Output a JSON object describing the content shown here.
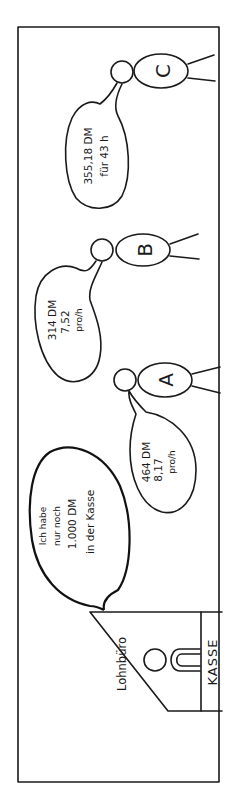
{
  "scene": {
    "office_label": "Lohnbüro",
    "cashier_label": "KASSE",
    "cashier_speech": [
      "Ich habe",
      "nur noch",
      "1.000 DM",
      "in der Kasse"
    ]
  },
  "workers": [
    {
      "name": "A",
      "speech": [
        "464 DM",
        "8,17",
        "pro/h"
      ]
    },
    {
      "name": "B",
      "speech": [
        "314 DM",
        "7,52",
        "pro/h"
      ]
    },
    {
      "name": "C",
      "speech": [
        "355,18 DM",
        "für 43 h"
      ]
    }
  ],
  "colors": {
    "ink": "#1a1a1a",
    "paper": "#ffffff"
  }
}
